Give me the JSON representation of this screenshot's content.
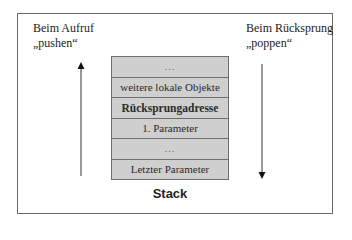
{
  "left_label": {
    "line1": "Beim Aufruf",
    "line2": "„pushen“"
  },
  "right_label": {
    "line1": "Beim Rücksprung",
    "line2": "„poppen“"
  },
  "stack": {
    "title": "Stack",
    "cells": [
      {
        "label": "...",
        "style": "dots"
      },
      {
        "label": "weitere lokale Objekte",
        "style": "normal"
      },
      {
        "label": "Rücksprungadresse",
        "style": "bold"
      },
      {
        "label": "1. Parameter",
        "style": "normal"
      },
      {
        "label": "...",
        "style": "dots"
      },
      {
        "label": "Letzter Parameter",
        "style": "normal"
      }
    ]
  },
  "arrows": {
    "left": {
      "direction": "up",
      "meaning": "push"
    },
    "right": {
      "direction": "down",
      "meaning": "pop"
    }
  },
  "colors": {
    "stack_fill": "#cfcfcf",
    "border": "#6e6e6e",
    "text": "#222222"
  }
}
